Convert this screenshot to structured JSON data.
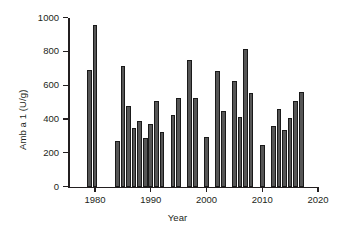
{
  "chart_data": {
    "type": "bar",
    "title": "",
    "xlabel": "Year",
    "ylabel": "Amb a 1 (U/g)",
    "xlim": [
      1976,
      2020
    ],
    "ylim": [
      0,
      1000
    ],
    "grid": false,
    "legend": "none",
    "bar_color": "#565656",
    "bar_edge_color": "#1a1a1a",
    "axis_color": "#231f20",
    "xticks": [
      1980,
      1990,
      2000,
      2010,
      2020
    ],
    "xtick_labels": [
      "1980",
      "1990",
      "2000",
      "2010",
      "2020"
    ],
    "yticks": [
      0,
      200,
      400,
      600,
      800,
      1000
    ],
    "ytick_labels": [
      "0",
      "200",
      "400",
      "600",
      "800",
      "1000"
    ],
    "categories": [
      1979,
      1980,
      1981,
      1984,
      1985,
      1986,
      1987,
      1988,
      1989,
      1990,
      1991,
      1992,
      1994,
      1995,
      1996,
      1997,
      1998,
      2000,
      2002,
      2003,
      2005,
      2006,
      2007,
      2008,
      2010,
      2012,
      2013,
      2014,
      2015,
      2016,
      2017
    ],
    "values": [
      690,
      955,
      268,
      715,
      478,
      345,
      390,
      285,
      372,
      508,
      325,
      425,
      525,
      750,
      525,
      295,
      685,
      448,
      625,
      410,
      815,
      555,
      248,
      358,
      460,
      335,
      405,
      508,
      558,
      0,
      0
    ],
    "points": [
      {
        "year": 1979,
        "value": 690
      },
      {
        "year": 1980,
        "value": 955
      },
      {
        "year": 1984,
        "value": 268
      },
      {
        "year": 1985,
        "value": 715
      },
      {
        "year": 1986,
        "value": 478
      },
      {
        "year": 1987,
        "value": 345
      },
      {
        "year": 1988,
        "value": 390
      },
      {
        "year": 1989,
        "value": 285
      },
      {
        "year": 1990,
        "value": 372
      },
      {
        "year": 1991,
        "value": 508
      },
      {
        "year": 1992,
        "value": 325
      },
      {
        "year": 1994,
        "value": 425
      },
      {
        "year": 1995,
        "value": 525
      },
      {
        "year": 1997,
        "value": 750
      },
      {
        "year": 1998,
        "value": 525
      },
      {
        "year": 2000,
        "value": 295
      },
      {
        "year": 2002,
        "value": 685
      },
      {
        "year": 2003,
        "value": 448
      },
      {
        "year": 2005,
        "value": 625
      },
      {
        "year": 2006,
        "value": 410
      },
      {
        "year": 2007,
        "value": 815
      },
      {
        "year": 2008,
        "value": 555
      },
      {
        "year": 2010,
        "value": 248
      },
      {
        "year": 2012,
        "value": 358
      },
      {
        "year": 2013,
        "value": 460
      },
      {
        "year": 2014,
        "value": 335
      },
      {
        "year": 2015,
        "value": 405
      },
      {
        "year": 2016,
        "value": 508
      },
      {
        "year": 2017,
        "value": 558
      }
    ]
  }
}
